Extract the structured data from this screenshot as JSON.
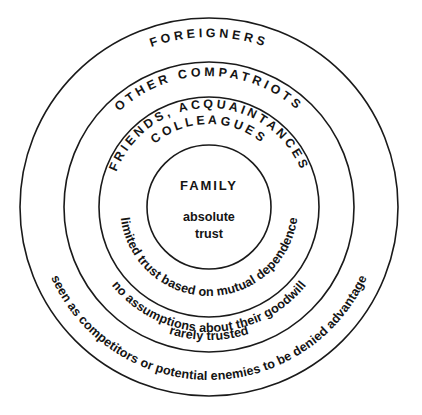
{
  "diagram": {
    "title_hidden": "Concentric circles of trust",
    "center": {
      "cx": 209,
      "cy": 207
    },
    "colors": {
      "outer_ring_fill": "#b2b2b2",
      "compatriots_ring_fill": "#c6c6c6",
      "friends_ring_fill": "#e3e3e3",
      "core_fill": "#ffffff",
      "outline": "#1a1a1a",
      "text": "#141414",
      "background": "#ffffff"
    },
    "rings": [
      {
        "id": "outer",
        "name": "foreigners",
        "radius": 189,
        "fill": "#b2b2b2",
        "top_label": "FOREIGNERS",
        "bottom_label": "seen as competitors or potential enemies to be denied advantage"
      },
      {
        "id": "compatriots",
        "name": "other-compatriots",
        "radius": 145,
        "fill": "#c6c6c6",
        "top_label": "OTHER COMPATRIOTS",
        "bottom_label": "rarely trusted",
        "bottom_label_secondary": "no assumptions about their goodwill"
      },
      {
        "id": "friends",
        "name": "friends-acquaintances-colleagues",
        "radius": 110,
        "fill": "#e3e3e3",
        "top_label_line1": "FRIENDS, ACQUAINTANCES",
        "top_label_line2": "COLLEAGUES",
        "bottom_label": "limited trust based on mutual dependence"
      },
      {
        "id": "core",
        "name": "family",
        "radius": 62,
        "fill": "#ffffff",
        "title": "FAMILY",
        "subtitle_line1": "absolute",
        "subtitle_line2": "trust"
      }
    ]
  }
}
